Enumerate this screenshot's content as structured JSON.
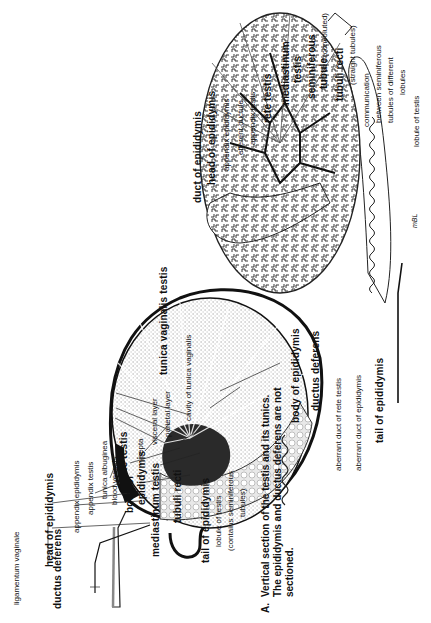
{
  "figure": {
    "orientation": "rotated-90-ccw",
    "caption_letter": "A.",
    "caption_lines": [
      "Vertical section of the testis and its tunics.",
      "The epididymis and ductus deferens are not",
      "sectioned."
    ]
  },
  "left_figure": {
    "labels": {
      "ligamentum_vaginale": "ligamentum vaginale",
      "head_of_epididymis": "head of epididymis",
      "appendix_epididymis": "appendix epididymis",
      "appendix_testis": "appendix testis",
      "tunica_albuginea": "tunica albuginea",
      "rete_testis": "rete testis",
      "septa": "septa",
      "visceral_layer": "visceral layer",
      "parietal_layer": "parietal layer",
      "tunica_vaginalis_testis": "tunica vaginalis testis",
      "cavity_of_tunica_vaginalis": "cavity of tunica vaginalis",
      "ductus_deferens": "ductus deferens",
      "blood_vessels": "blood vessels",
      "body_of": "body of",
      "epididymis": "epididymis",
      "mediastinum_testis": "mediastinum testis",
      "tubuli_recti": "tubuli recti",
      "tail_of_epididymis": "tail of epididymis",
      "lobule_of_testis": "lobule of testis",
      "contains_seminiferous": "(contains seminiferous",
      "tubules": "tubules)"
    }
  },
  "right_figure": {
    "labels": {
      "duct_of_epididymis": "duct of epididymis",
      "head_of_epididymis": "head of epididymis",
      "appendix_epididymis": "appendix epididymis",
      "efferent_ductule": "efferent ductule",
      "appendix_testis": "appendix testis",
      "rete_testis": "rete testis",
      "mediastinum": "mediastinum",
      "testis": "testis",
      "seminiferous": "seminiferous",
      "tubule": "tubule",
      "convoluted": "(convoluted)",
      "tubuli_recti": "tubuli recti",
      "straight_tubules": "(straight tubules)",
      "communication": "communication",
      "between_seminiferous": "between seminiferous",
      "tubules_of_different": "tubules of different",
      "lobules": "lobules",
      "lobule_of_testis": "lobule of testis",
      "body_of_epididymis": "body of epididymis",
      "ductus_deferens": "ductus deferens",
      "aberrant_duct_of_rete_testis": "aberrant duct of rete testis",
      "aberrant_duct_of_epididymis": "aberrant duct of epididymis",
      "tail_of_epididymis": "tail of epididymis",
      "signature": "mBL"
    }
  },
  "colors": {
    "ink": "#111111",
    "background": "#ffffff",
    "stipple": "#9a9a9a",
    "dark_region": "#222222"
  }
}
